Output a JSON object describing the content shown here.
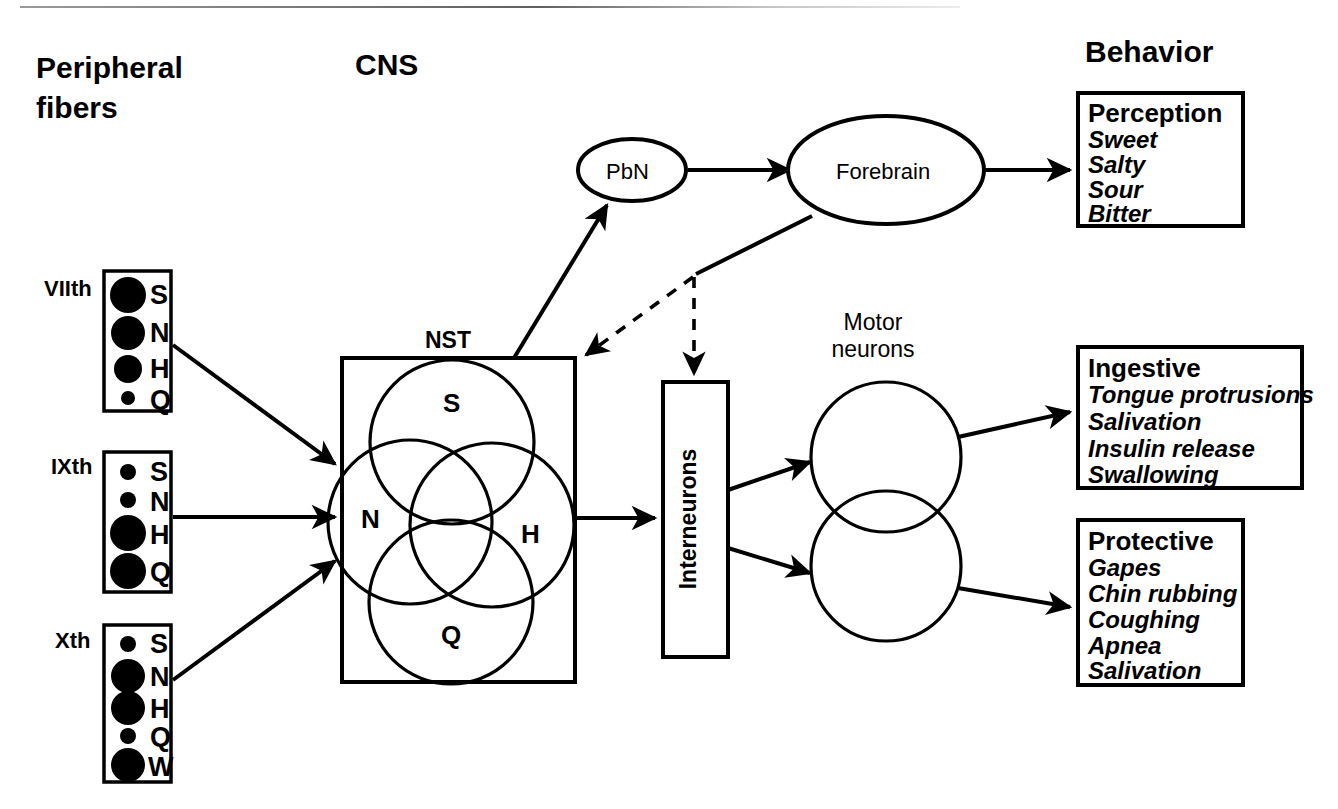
{
  "figure": {
    "title_columns": {
      "peripheral": "Peripheral\nfibers",
      "peripheral_line1": "Peripheral",
      "peripheral_line2": "fibers",
      "cns": "CNS",
      "behavior": "Behavior"
    },
    "nerves": [
      {
        "name": "VIIth",
        "qualities": [
          {
            "label": "S",
            "size": "large"
          },
          {
            "label": "N",
            "size": "large"
          },
          {
            "label": "H",
            "size": "medium"
          },
          {
            "label": "Q",
            "size": "small"
          }
        ]
      },
      {
        "name": "IXth",
        "qualities": [
          {
            "label": "S",
            "size": "small"
          },
          {
            "label": "N",
            "size": "small"
          },
          {
            "label": "H",
            "size": "large"
          },
          {
            "label": "Q",
            "size": "large"
          }
        ]
      },
      {
        "name": "Xth",
        "qualities": [
          {
            "label": "S",
            "size": "small"
          },
          {
            "label": "N",
            "size": "large"
          },
          {
            "label": "H",
            "size": "large"
          },
          {
            "label": "Q",
            "size": "small"
          },
          {
            "label": "W",
            "size": "large"
          }
        ]
      }
    ],
    "nst": {
      "label": "NST",
      "circles": [
        {
          "label": "S"
        },
        {
          "label": "N"
        },
        {
          "label": "H"
        },
        {
          "label": "Q"
        }
      ]
    },
    "nodes": {
      "pbn": "PbN",
      "forebrain": "Forebrain",
      "interneurons": "Interneurons",
      "motor_neurons_line1": "Motor",
      "motor_neurons_line2": "neurons"
    },
    "behavior_boxes": [
      {
        "heading": "Perception",
        "items": [
          "Sweet",
          "Salty",
          "Sour",
          "Bitter"
        ]
      },
      {
        "heading": "Ingestive",
        "items": [
          "Tongue protrusions",
          "Salivation",
          "Insulin release",
          "Swallowing"
        ]
      },
      {
        "heading": "Protective",
        "items": [
          "Gapes",
          "Chin rubbing",
          "Coughing",
          "Apnea",
          "Salivation"
        ]
      }
    ],
    "colors": {
      "ink": "#000000",
      "background": "#ffffff"
    }
  }
}
